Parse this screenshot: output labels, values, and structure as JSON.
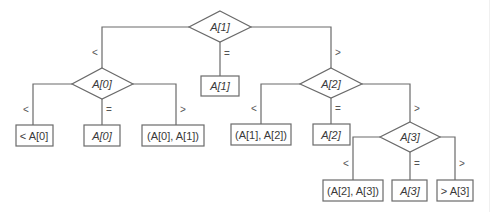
{
  "diagram": {
    "type": "decision-tree",
    "root": {
      "label": "A[1]",
      "children": [
        {
          "edge": "<",
          "label": "A[0]",
          "children": [
            {
              "edge": "<",
              "label": "< A[0]"
            },
            {
              "edge": "=",
              "label": "A[0]"
            },
            {
              "edge": ">",
              "label": "(A[0], A[1])"
            }
          ]
        },
        {
          "edge": "=",
          "label": "A[1]"
        },
        {
          "edge": ">",
          "label": "A[2]",
          "children": [
            {
              "edge": "<",
              "label": "(A[1], A[2])"
            },
            {
              "edge": "=",
              "label": "A[2]"
            },
            {
              "edge": ">",
              "label": "A[3]",
              "children": [
                {
                  "edge": "<",
                  "label": "(A[2], A[3])"
                },
                {
                  "edge": "=",
                  "label": "A[3]"
                },
                {
                  "edge": ">",
                  "label": "> A[3]"
                }
              ]
            }
          ]
        }
      ]
    }
  },
  "nodes": {
    "d_a1": "A[1]",
    "d_a0": "A[0]",
    "d_a2": "A[2]",
    "d_a3": "A[3]",
    "l_a1": "A[1]",
    "l_lt_a0": "< A[0]",
    "l_a0": "A[0]",
    "l_a0_a1": "(A[0], A[1])",
    "l_a1_a2": "(A[1], A[2])",
    "l_a2": "A[2]",
    "l_a2_a3": "(A[2], A[3])",
    "l_a3": "A[3]",
    "l_gt_a3": "> A[3]"
  },
  "edges": {
    "lt": "<",
    "eq": "=",
    "gt": ">"
  },
  "colors": {
    "stroke": "#6a6a6a",
    "text": "#3a3a3a",
    "background": "#ffffff"
  }
}
